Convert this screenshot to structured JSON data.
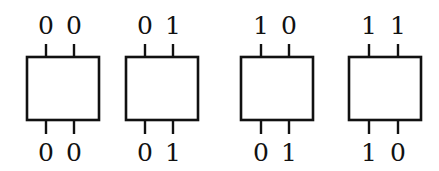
{
  "diagram": {
    "stroke_color": "#111111",
    "background": "#ffffff",
    "boxes": [
      {
        "inputs": [
          "0",
          "0"
        ],
        "outputs": [
          "0",
          "0"
        ],
        "x": 27,
        "pins_x": [
          46,
          74
        ],
        "width": 72
      },
      {
        "inputs": [
          "0",
          "1"
        ],
        "outputs": [
          "0",
          "1"
        ],
        "x": 126,
        "pins_x": [
          145,
          173
        ],
        "width": 72
      },
      {
        "inputs": [
          "1",
          "0"
        ],
        "outputs": [
          "0",
          "1"
        ],
        "x": 241,
        "pins_x": [
          261,
          289
        ],
        "width": 72
      },
      {
        "inputs": [
          "1",
          "1"
        ],
        "outputs": [
          "1",
          "0"
        ],
        "x": 349,
        "pins_x": [
          369,
          398
        ],
        "width": 72
      }
    ]
  }
}
